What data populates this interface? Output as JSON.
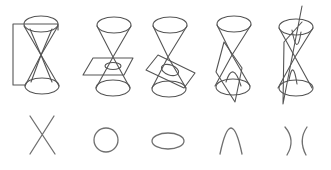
{
  "diagram": {
    "stroke_color": "#555555",
    "curve_color": "#707070",
    "background": "#ffffff",
    "figures": [
      {
        "id": "degenerate-lines",
        "description": "Double cone cut by a vertical plane through the apex",
        "section": "two intersecting lines",
        "section_icon": "x-cross"
      },
      {
        "id": "circle",
        "description": "Double cone cut by a horizontal plane",
        "section": "circle",
        "section_icon": "circle"
      },
      {
        "id": "ellipse",
        "description": "Double cone cut by a tilted plane",
        "section": "ellipse",
        "section_icon": "ellipse"
      },
      {
        "id": "parabola",
        "description": "Double cone cut by a plane parallel to a generator",
        "section": "parabola",
        "section_icon": "parabola"
      },
      {
        "id": "hyperbola",
        "description": "Double cone cut by a vertical plane intersecting both nappes",
        "section": "hyperbola",
        "section_icon": "hyperbola"
      }
    ]
  }
}
